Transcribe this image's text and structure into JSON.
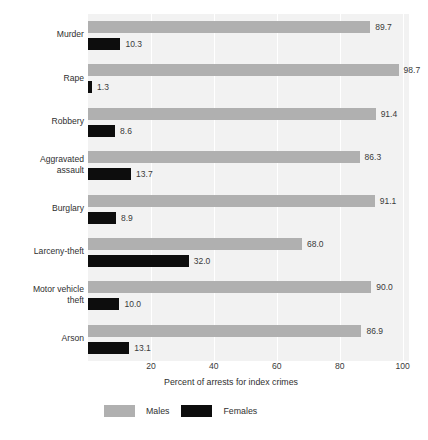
{
  "chart_data": {
    "type": "bar",
    "title": "",
    "subtitle": "",
    "orientation": "horizontal",
    "grouped": true,
    "xlabel": "Percent of arrests for index crimes",
    "ylabel": "",
    "xlim": [
      0,
      102
    ],
    "xticks": [
      20,
      40,
      60,
      80,
      100
    ],
    "xtick_labels": [
      "20",
      "40",
      "60",
      "80",
      "100"
    ],
    "grid": true,
    "grid_axis": "x",
    "legend_position": "bottom-left",
    "categories": [
      "Murder",
      "Rape",
      "Robbery",
      "Aggravated assault",
      "Burglary",
      "Larceny-theft",
      "Motor vehicle theft",
      "Arson"
    ],
    "category_lines": [
      [
        "Murder"
      ],
      [
        "Rape"
      ],
      [
        "Robbery"
      ],
      [
        "Aggravated",
        "assault"
      ],
      [
        "Burglary"
      ],
      [
        "Larceny-theft"
      ],
      [
        "Motor vehicle",
        "theft"
      ],
      [
        "Arson"
      ]
    ],
    "series": [
      {
        "name": "Males",
        "color": "#b0b0b0",
        "values": [
          89.7,
          98.7,
          91.4,
          86.3,
          91.1,
          68.0,
          90.0,
          86.9
        ],
        "labels": [
          "89.7",
          "98.7",
          "91.4",
          "86.3",
          "91.1",
          "68.0",
          "90.0",
          "86.9"
        ]
      },
      {
        "name": "Females",
        "color": "#0d0d0d",
        "values": [
          10.3,
          1.3,
          8.6,
          13.7,
          8.9,
          32.0,
          10.0,
          13.1
        ],
        "labels": [
          "10.3",
          "1.3",
          "8.6",
          "13.7",
          "8.9",
          "32.0",
          "10.0",
          "13.1"
        ]
      }
    ]
  },
  "legend": {
    "items": [
      {
        "label": "Males",
        "color": "#b0b0b0"
      },
      {
        "label": "Females",
        "color": "#0d0d0d"
      }
    ]
  },
  "colors": {
    "plot_background": "#f2f2f2",
    "gridline": "#ffffff",
    "text": "#2f2f2f",
    "male_bar": "#b0b0b0",
    "female_bar": "#0d0d0d"
  }
}
